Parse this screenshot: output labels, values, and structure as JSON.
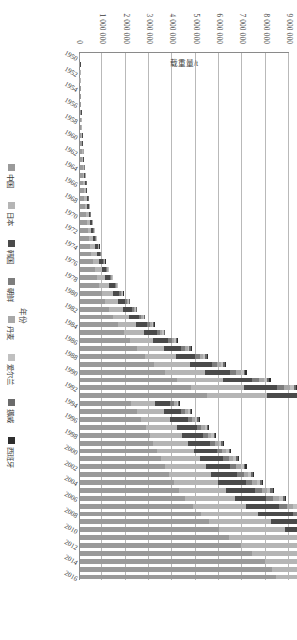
{
  "chart_data": {
    "type": "bar",
    "subtype": "stacked-vertical",
    "title": "",
    "xlabel": "年份",
    "ylabel": "载重量/t",
    "ylim": [
      0,
      9000000
    ],
    "ytick_values": [
      0,
      1000000,
      2000000,
      3000000,
      4000000,
      5000000,
      6000000,
      7000000,
      8000000,
      9000000
    ],
    "ytick_labels": [
      "0",
      "1 000 000",
      "2 000 000",
      "3 000 000",
      "4 000 000",
      "5 000 000",
      "6 000 000",
      "7 000 000",
      "8 000 000",
      "9 000 000"
    ],
    "grid": true,
    "grid_axis": "y",
    "legend_position": "bottom",
    "legend": [
      "中国",
      "日本",
      "韩国",
      "朝鲜",
      "丹麦",
      "爱尔兰",
      "挪威",
      "西班牙"
    ],
    "colors": {
      "中国": "#9a9a9a",
      "日本": "#b5b5b5",
      "韩国": "#4a4a4a",
      "朝鲜": "#7d7d7d",
      "丹麦": "#a8a8a8",
      "爱尔兰": "#c0c0c0",
      "挪威": "#6b6b6b",
      "西班牙": "#2e2e2e"
    },
    "categories": [
      "1950",
      "1951",
      "1952",
      "1953",
      "1954",
      "1955",
      "1956",
      "1957",
      "1958",
      "1959",
      "1960",
      "1961",
      "1962",
      "1963",
      "1964",
      "1965",
      "1966",
      "1967",
      "1968",
      "1969",
      "1970",
      "1971",
      "1972",
      "1973",
      "1974",
      "1975",
      "1976",
      "1977",
      "1978",
      "1979",
      "1980",
      "1981",
      "1982",
      "1983",
      "1984",
      "1985",
      "1986",
      "1987",
      "1988",
      "1989",
      "1990",
      "1991",
      "1992",
      "1993",
      "1994",
      "1995",
      "1996",
      "1997",
      "1998",
      "1999",
      "2000",
      "2001",
      "2002",
      "2003",
      "2004",
      "2005",
      "2006",
      "2007",
      "2008",
      "2009",
      "2010",
      "2011",
      "2012",
      "2013",
      "2014",
      "2015",
      "2016"
    ],
    "xtick_labels": [
      "1950",
      "1952",
      "1954",
      "1956",
      "1958",
      "1960",
      "1962",
      "1964",
      "1966",
      "1968",
      "1970",
      "1972",
      "1974",
      "1976",
      "1978",
      "1980",
      "1982",
      "1984",
      "1986",
      "1988",
      "1990",
      "1992",
      "1994",
      "1996",
      "1998",
      "2000",
      "2002",
      "2004",
      "2006",
      "2008",
      "2010",
      "2012",
      "2014",
      "2016"
    ],
    "series": [
      {
        "name": "中国",
        "values": [
          12000,
          14000,
          17000,
          20000,
          24000,
          28000,
          33000,
          39000,
          46000,
          54000,
          63000,
          72000,
          83000,
          95000,
          110000,
          126000,
          145000,
          166000,
          190000,
          218000,
          250000,
          286000,
          327000,
          374000,
          428000,
          489000,
          559000,
          639000,
          731000,
          836000,
          956000,
          1093000,
          1249000,
          1428000,
          1632000,
          1866000,
          2133000,
          2438000,
          2787000,
          3186000,
          3642000,
          4164000,
          4760000,
          5441000,
          2190000,
          2450000,
          2620000,
          2830000,
          2980000,
          3150000,
          3320000,
          3480000,
          3650000,
          3820000,
          4020000,
          4250000,
          4520000,
          4830000,
          5180000,
          5550000,
          5960000,
          6400000,
          6880000,
          7390000,
          7940000,
          8210000,
          8380000
        ]
      },
      {
        "name": "日本",
        "values": [
          6000,
          7000,
          8000,
          9000,
          11000,
          13000,
          15000,
          18000,
          21000,
          25000,
          29000,
          34000,
          39000,
          45000,
          52000,
          60000,
          69000,
          79000,
          91000,
          104000,
          119000,
          136000,
          156000,
          178000,
          204000,
          233000,
          266000,
          304000,
          348000,
          398000,
          455000,
          520000,
          595000,
          680000,
          777000,
          888000,
          1015000,
          1160000,
          1326000,
          1516000,
          1733000,
          1981000,
          2265000,
          2589000,
          1040000,
          1160000,
          1240000,
          1340000,
          1410000,
          1490000,
          1570000,
          1650000,
          1730000,
          1810000,
          1900000,
          2010000,
          2140000,
          2290000,
          2450000,
          2630000,
          2820000,
          3030000,
          3260000,
          3500000,
          3760000,
          3890000,
          3970000
        ]
      },
      {
        "name": "韩国",
        "values": [
          4000,
          5000,
          5500,
          6000,
          7000,
          8000,
          9500,
          11000,
          13000,
          15000,
          18000,
          21000,
          24000,
          28000,
          32000,
          37000,
          42000,
          48000,
          56000,
          64000,
          73000,
          84000,
          96000,
          110000,
          126000,
          144000,
          164000,
          188000,
          215000,
          246000,
          281000,
          321000,
          367000,
          420000,
          480000,
          548000,
          627000,
          717000,
          819000,
          936000,
          1070000,
          1223000,
          1398000,
          1598000,
          642000,
          716000,
          766000,
          827000,
          871000,
          920000,
          970000,
          1018000,
          1067000,
          1117000,
          1175000,
          1242000,
          1321000,
          1412000,
          1514000,
          1622000,
          1742000,
          1871000,
          2011000,
          2160000,
          2321000,
          2400000,
          2450000
        ]
      },
      {
        "name": "朝鲜",
        "values": [
          1000,
          1200,
          1400,
          1600,
          1800,
          2100,
          2400,
          2800,
          3200,
          3700,
          4300,
          5000,
          5700,
          6600,
          7600,
          8800,
          10000,
          11500,
          13300,
          15200,
          17500,
          20000,
          23000,
          26200,
          30000,
          34300,
          39200,
          44800,
          51200,
          58500,
          66900,
          76500,
          87400,
          99900,
          114000,
          130000,
          149000,
          170000,
          195000,
          223000,
          254000,
          291000,
          332000,
          380000,
          153000,
          170000,
          182000,
          197000,
          207000,
          219000,
          231000,
          242000,
          254000,
          266000,
          279000,
          295000,
          314000,
          336000,
          360000,
          386000,
          414000,
          445000,
          478000,
          514000,
          552000,
          571000,
          583000
        ]
      },
      {
        "name": "丹麦",
        "values": [
          800,
          900,
          1000,
          1200,
          1400,
          1600,
          1800,
          2100,
          2400,
          2800,
          3200,
          3700,
          4300,
          5000,
          5700,
          6600,
          7500,
          8600,
          10000,
          11400,
          13100,
          15000,
          17200,
          19700,
          22500,
          25700,
          29400,
          33600,
          38400,
          43900,
          50200,
          57400,
          65600,
          75000,
          85700,
          98000,
          112000,
          128000,
          146000,
          167000,
          191000,
          218000,
          250000,
          285000,
          115000,
          128000,
          137000,
          148000,
          156000,
          164000,
          173000,
          182000,
          191000,
          200000,
          210000,
          222000,
          236000,
          252000,
          270000,
          290000,
          311000,
          334000,
          359000,
          386000,
          414000,
          428000,
          437000
        ]
      },
      {
        "name": "爱尔兰",
        "values": [
          500,
          600,
          700,
          800,
          900,
          1000,
          1200,
          1400,
          1600,
          1800,
          2100,
          2400,
          2800,
          3200,
          3700,
          4200,
          4800,
          5600,
          6400,
          7300,
          8400,
          9600,
          11000,
          12600,
          14400,
          16500,
          18800,
          21500,
          24600,
          28100,
          32100,
          36700,
          42000,
          48000,
          54900,
          62700,
          71700,
          81900,
          93700,
          107000,
          122000,
          140000,
          160000,
          183000,
          73000,
          82000,
          88000,
          95000,
          100000,
          105000,
          111000,
          116000,
          122000,
          128000,
          135000,
          142000,
          151000,
          162000,
          173000,
          186000,
          199000,
          214000,
          230000,
          247000,
          265000,
          274000,
          280000
        ]
      },
      {
        "name": "挪威",
        "values": [
          300,
          400,
          450,
          500,
          600,
          700,
          800,
          900,
          1000,
          1200,
          1400,
          1600,
          1800,
          2100,
          2400,
          2800,
          3200,
          3700,
          4200,
          4800,
          5500,
          6300,
          7200,
          8300,
          9500,
          10800,
          12400,
          14100,
          16200,
          18500,
          21100,
          24100,
          27600,
          31500,
          36000,
          41200,
          47100,
          53800,
          61500,
          70300,
          80300,
          91800,
          105000,
          120000,
          48000,
          54000,
          58000,
          62000,
          66000,
          69000,
          73000,
          76000,
          80000,
          84000,
          88000,
          93000,
          99000,
          106000,
          114000,
          122000,
          131000,
          140000,
          151000,
          162000,
          174000,
          180000,
          184000
        ]
      },
      {
        "name": "西班牙",
        "values": [
          200,
          250,
          300,
          350,
          400,
          450,
          500,
          600,
          700,
          800,
          900,
          1000,
          1200,
          1400,
          1600,
          1800,
          2100,
          2400,
          2800,
          3200,
          3600,
          4200,
          4800,
          5500,
          6300,
          7200,
          8200,
          9400,
          10700,
          12300,
          14000,
          16000,
          18300,
          20900,
          23900,
          27300,
          31200,
          35700,
          40800,
          46600,
          53300,
          60900,
          69600,
          79600,
          32000,
          36000,
          38000,
          41000,
          43000,
          46000,
          48000,
          51000,
          53000,
          56000,
          58000,
          62000,
          66000,
          70000,
          75000,
          81000,
          87000,
          93000,
          100000,
          107000,
          115000,
          119000,
          122000
        ]
      }
    ]
  }
}
